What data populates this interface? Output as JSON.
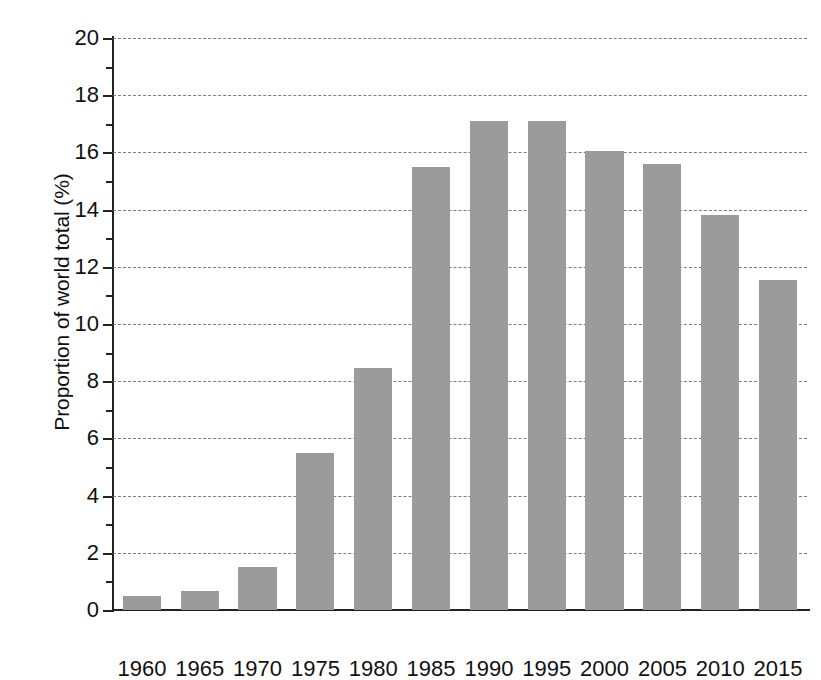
{
  "chart_data": {
    "type": "bar",
    "title": "",
    "subtitle": "",
    "xlabel": "",
    "ylabel": "Proportion of world total (%)",
    "categories": [
      "1960",
      "1965",
      "1970",
      "1975",
      "1980",
      "1985",
      "1990",
      "1995",
      "2000",
      "2005",
      "2010",
      "2015"
    ],
    "values": [
      0.5,
      0.65,
      1.5,
      5.5,
      8.45,
      15.5,
      17.1,
      17.1,
      16.05,
      15.6,
      13.8,
      11.55
    ],
    "ylim": [
      0,
      20
    ],
    "y_major_ticks": [
      0,
      2,
      4,
      6,
      8,
      10,
      12,
      14,
      16,
      18,
      20
    ],
    "y_minor_ticks": [
      1,
      3,
      5,
      7,
      9,
      11,
      13,
      15,
      17,
      19
    ],
    "y_tick_labels": [
      "0",
      "2",
      "4",
      "6",
      "8",
      "10",
      "12",
      "14",
      "16",
      "18",
      "20"
    ],
    "grid": true,
    "grid_axis": "y",
    "grid_style": "dashed",
    "legend": null,
    "legend_position": "none",
    "bar_color": "#9b9b9b",
    "axis_color": "#222222",
    "grid_color": "#7d7d7d",
    "background_color": "#ffffff",
    "annotations": []
  }
}
